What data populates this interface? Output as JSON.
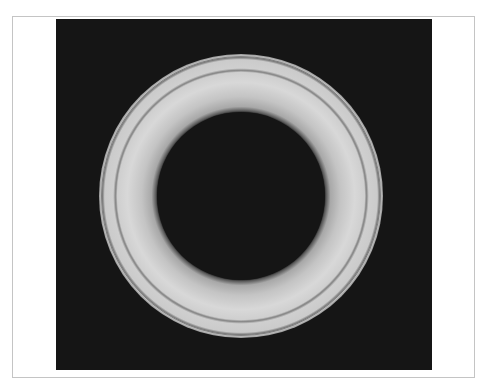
{
  "image": {
    "subject": "circular ring (annulus) on black background",
    "caption": "Light grey ring with concentric bands on a black square",
    "colors": {
      "page_background": "#ffffff",
      "frame_border": "#c4c4c4",
      "plate_background": "#151515",
      "ring_outer_band": "#c9c9c9",
      "ring_inner_band": "#d6d6d6",
      "ring_inner_shadow": "#a8a8a8",
      "ring_groove": "#8a8a8a",
      "ring_rim_line": "#6e6e6e",
      "hole": "#151515"
    },
    "ring": {
      "center_x": 185,
      "center_y": 177,
      "outer_radius": 142,
      "groove_radius": 126,
      "inner_radius": 85
    }
  }
}
